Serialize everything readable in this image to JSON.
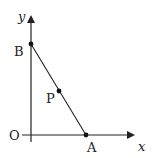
{
  "diagram": {
    "axes": {
      "x_label": "x",
      "y_label": "y",
      "origin_label": "O"
    },
    "points": {
      "A": {
        "label": "A"
      },
      "B": {
        "label": "B"
      },
      "P": {
        "label": "P"
      }
    },
    "segment": "AB",
    "colors": {
      "stroke": "#222222",
      "background": "#ffffff"
    }
  }
}
